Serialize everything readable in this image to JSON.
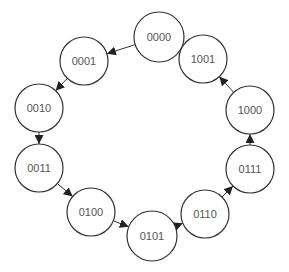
{
  "title": "",
  "diagram": {
    "type": "state-transition-cycle",
    "nodes": [
      {
        "id": "s0",
        "label": "0000",
        "cx": 159,
        "cy": 37,
        "r": 25
      },
      {
        "id": "s1",
        "label": "0001",
        "cx": 84,
        "cy": 61,
        "r": 24
      },
      {
        "id": "s2",
        "label": "0010",
        "cx": 39,
        "cy": 108,
        "r": 24
      },
      {
        "id": "s3",
        "label": "0011",
        "cx": 39,
        "cy": 168,
        "r": 24
      },
      {
        "id": "s4",
        "label": "0100",
        "cx": 91,
        "cy": 212,
        "r": 24
      },
      {
        "id": "s5",
        "label": "0101",
        "cx": 152,
        "cy": 236,
        "r": 25
      },
      {
        "id": "s6",
        "label": "0110",
        "cx": 205,
        "cy": 214,
        "r": 24
      },
      {
        "id": "s7",
        "label": "0111",
        "cx": 250,
        "cy": 169,
        "r": 24
      },
      {
        "id": "s8",
        "label": "1000",
        "cx": 250,
        "cy": 110,
        "r": 24
      },
      {
        "id": "s9",
        "label": "1001",
        "cx": 203,
        "cy": 59,
        "r": 24
      }
    ],
    "edges": [
      {
        "from": "s0",
        "to": "s1"
      },
      {
        "from": "s1",
        "to": "s2"
      },
      {
        "from": "s2",
        "to": "s3"
      },
      {
        "from": "s3",
        "to": "s4"
      },
      {
        "from": "s4",
        "to": "s5"
      },
      {
        "from": "s5",
        "to": "s6"
      },
      {
        "from": "s6",
        "to": "s7"
      },
      {
        "from": "s7",
        "to": "s8"
      },
      {
        "from": "s8",
        "to": "s9"
      },
      {
        "from": "s9",
        "to": "s0"
      }
    ],
    "colors": {
      "stroke": "#333333",
      "text": "#555555",
      "fill": "#ffffff"
    }
  }
}
